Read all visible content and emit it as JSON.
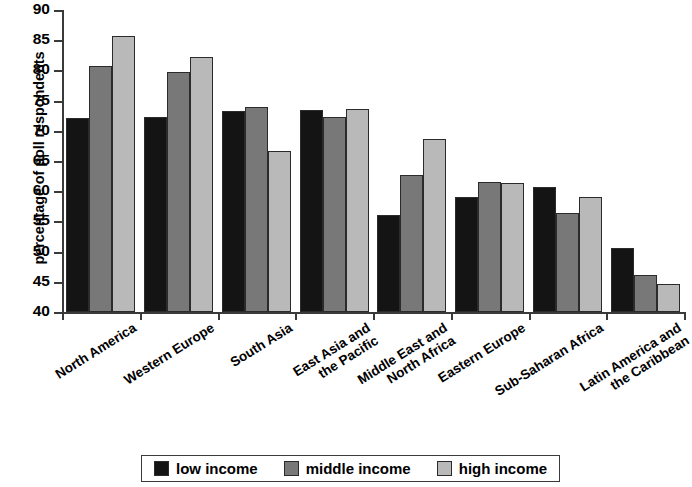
{
  "chart_data": {
    "type": "bar",
    "title": "",
    "xlabel": "",
    "ylabel": "percentage of poll respondents",
    "ylim": [
      40,
      90
    ],
    "ytick_step": 5,
    "yticks": [
      90,
      85,
      80,
      75,
      70,
      65,
      60,
      55,
      50,
      45,
      40
    ],
    "grid": false,
    "legend_position": "bottom",
    "categories": [
      "North America",
      "Western Europe",
      "South Asia",
      "East Asia and\nthe Pacific",
      "Middle East and\nNorth Africa",
      "Eastern Europe",
      "Sub-Saharan Africa",
      "Latin America and\nthe Caribbean"
    ],
    "series": [
      {
        "name": "low income",
        "color": "#141414",
        "values": [
          72.1,
          72.3,
          73.2,
          73.4,
          56.0,
          59.0,
          60.7,
          50.6
        ]
      },
      {
        "name": "middle income",
        "color": "#787878",
        "values": [
          80.8,
          79.7,
          74.0,
          72.3,
          62.7,
          61.5,
          56.4,
          46.2
        ]
      },
      {
        "name": "high income",
        "color": "#b9b9b9",
        "values": [
          85.7,
          82.3,
          66.6,
          73.6,
          68.6,
          61.3,
          59.0,
          44.6
        ]
      }
    ]
  }
}
